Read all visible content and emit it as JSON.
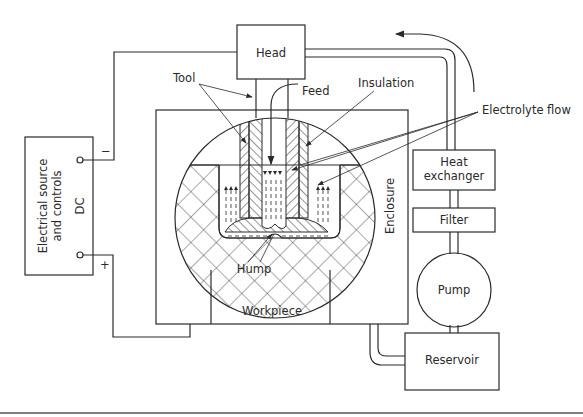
{
  "diagram": {
    "components": {
      "head": "Head",
      "tool": "Tool",
      "feed": "Feed",
      "insulation": "Insulation",
      "electrolyte_flow": "Electrolyte flow",
      "heat_exchanger_line1": "Heat",
      "heat_exchanger_line2": "exchanger",
      "filter": "Filter",
      "pump": "Pump",
      "reservoir": "Reservoir",
      "enclosure": "Enclosure",
      "workpiece": "Workpiece",
      "hump": "Hump",
      "source_line1": "Electrical source",
      "source_line2": "and controls",
      "source_dc": "DC",
      "terminal_negative": "−",
      "terminal_positive": "+"
    },
    "colors": {
      "line": "#2a2a2a",
      "background": "#ffffff"
    }
  }
}
